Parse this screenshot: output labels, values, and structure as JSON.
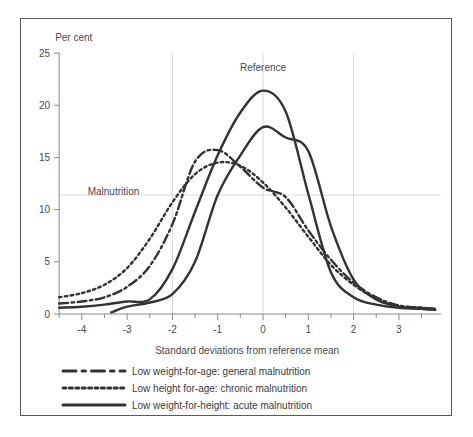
{
  "chart_data": {
    "type": "line",
    "title": "",
    "ylabel": "Per cent",
    "xlabel": "Standard deviations from reference mean",
    "xlim": [
      -4.5,
      3.8
    ],
    "ylim": [
      0,
      25
    ],
    "xticks": [
      -4,
      -3,
      -2,
      -1,
      0,
      1,
      2,
      3
    ],
    "xticklabels": [
      "-4",
      "-3",
      "-2",
      "-1",
      "0",
      "1",
      "2",
      "3"
    ],
    "yticks": [
      0,
      5,
      10,
      15,
      20,
      25
    ],
    "yticklabels": [
      "0",
      "5",
      "10",
      "15",
      "20",
      "25"
    ],
    "grid": true,
    "gridlines_x": [
      -2,
      0,
      2
    ],
    "gridlines_y": [
      11.4
    ],
    "annotations": [
      {
        "text": "Reference",
        "x": 0.0,
        "y": 23.3
      },
      {
        "text": "Malnutrition",
        "x": -3.3,
        "y": 11.4
      }
    ],
    "legend_position": "below",
    "series": [
      {
        "name": "Low weight-for-age: general malnutrition",
        "style": "dash-dot",
        "color": "#333333",
        "x": [
          -4.5,
          -4.0,
          -3.5,
          -3.0,
          -2.5,
          -2.0,
          -1.5,
          -1.0,
          -0.5,
          0.0,
          0.5,
          1.0,
          1.5,
          2.0,
          2.5,
          3.0,
          3.5,
          3.8
        ],
        "values": [
          1.0,
          1.2,
          1.6,
          2.6,
          4.6,
          8.6,
          14.6,
          15.7,
          14.1,
          12.1,
          11.2,
          8.0,
          5.2,
          3.0,
          1.6,
          0.8,
          0.6,
          0.5
        ]
      },
      {
        "name": "Low height for-age: chronic malnutrition",
        "style": "dotted",
        "color": "#333333",
        "x": [
          -4.5,
          -4.0,
          -3.5,
          -3.0,
          -2.5,
          -2.0,
          -1.5,
          -1.0,
          -0.5,
          0.0,
          0.5,
          1.0,
          1.5,
          2.0,
          2.5,
          3.0,
          3.5,
          3.8
        ],
        "values": [
          1.6,
          2.0,
          2.8,
          4.4,
          7.2,
          10.7,
          13.4,
          14.5,
          14.2,
          12.6,
          10.2,
          7.4,
          4.7,
          2.8,
          1.5,
          0.8,
          0.6,
          0.5
        ]
      },
      {
        "name": "Low weight-for-height: acute malnutrition",
        "style": "solid",
        "color": "#333333",
        "x": [
          -4.5,
          -4.0,
          -3.5,
          -3.0,
          -2.5,
          -2.0,
          -1.5,
          -1.0,
          -0.5,
          0.0,
          0.5,
          1.0,
          1.5,
          2.0,
          2.5,
          3.0,
          3.5,
          3.8
        ],
        "values": [
          0.6,
          0.7,
          0.9,
          1.2,
          1.4,
          4.3,
          9.8,
          15.2,
          19.3,
          21.4,
          19.4,
          11.5,
          4.0,
          1.6,
          0.9,
          0.6,
          0.5,
          0.4
        ]
      },
      {
        "name": "Low weight-for-height: acute malnutrition (secondary)",
        "style": "solid",
        "color": "#333333",
        "x": [
          -3.35,
          -3.0,
          -2.5,
          -2.0,
          -1.5,
          -1.0,
          -0.5,
          0.0,
          0.5,
          1.0,
          1.5,
          2.0,
          2.5,
          3.0,
          3.5,
          3.8
        ],
        "values": [
          0.15,
          0.7,
          1.1,
          1.9,
          5.0,
          11.4,
          15.2,
          17.9,
          16.9,
          15.6,
          8.4,
          3.3,
          1.4,
          0.7,
          0.5,
          0.4
        ]
      }
    ]
  },
  "legend": {
    "items": [
      {
        "label": "Low weight-for-age: general malnutrition",
        "style": "dash-dot"
      },
      {
        "label": "Low height for-age: chronic malnutrition",
        "style": "dotted"
      },
      {
        "label": "Low weight-for-height: acute malnutrition",
        "style": "solid"
      }
    ]
  }
}
